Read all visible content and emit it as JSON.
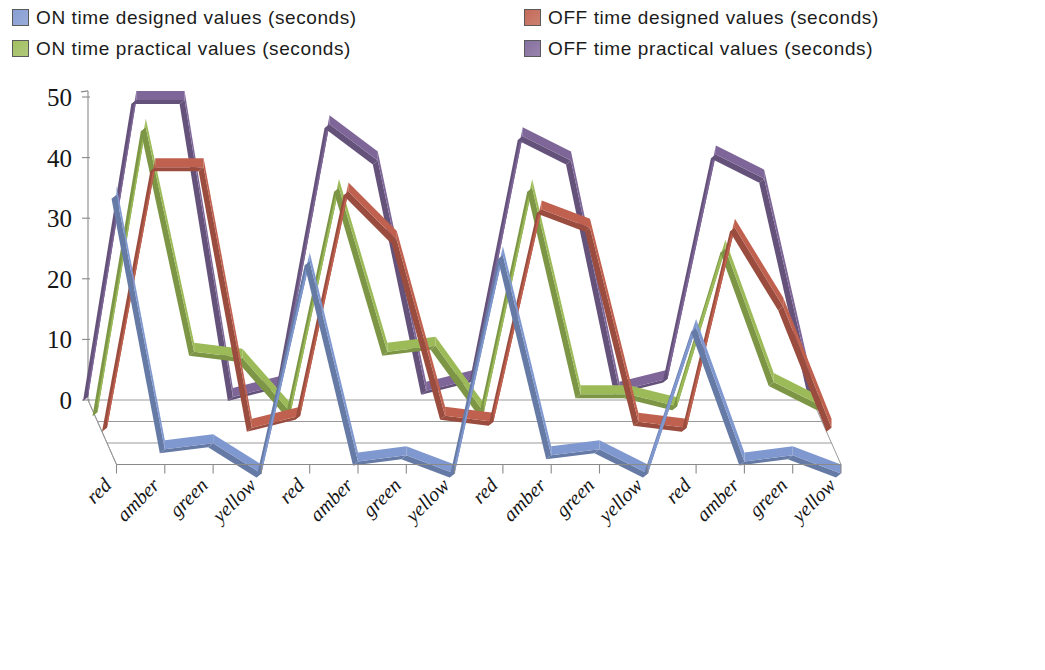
{
  "legend": {
    "items": [
      {
        "label": "ON time designed values (seconds)",
        "color": "#8098d0",
        "icon": "legend-swatch-blue"
      },
      {
        "label": "OFF time designed values (seconds)",
        "color": "#c0604e",
        "icon": "legend-swatch-red"
      },
      {
        "label": "ON time practical values (seconds)",
        "color": "#9cbb58",
        "icon": "legend-swatch-green"
      },
      {
        "label": "OFF time practical values (seconds)",
        "color": "#7e6699",
        "icon": "legend-swatch-purple"
      }
    ]
  },
  "axes": {
    "y_ticks": [
      "0",
      "10",
      "20",
      "30",
      "40",
      "50"
    ],
    "y_min": 0,
    "y_max": 50,
    "x_categories": [
      "red",
      "amber",
      "green",
      "yellow",
      "red",
      "amber",
      "green",
      "yellow",
      "red",
      "amber",
      "green",
      "yellow",
      "red",
      "amber",
      "green",
      "yellow"
    ]
  },
  "chart_data": {
    "type": "line",
    "title": "",
    "xlabel": "",
    "ylabel": "",
    "ylim": [
      0,
      50
    ],
    "grid": false,
    "legend_position": "top",
    "projection": "3d",
    "categories": [
      "red",
      "amber",
      "green",
      "yellow",
      "red",
      "amber",
      "green",
      "yellow",
      "red",
      "amber",
      "green",
      "yellow",
      "red",
      "amber",
      "green",
      "yellow"
    ],
    "series": [
      {
        "name": "ON time designed values (seconds)",
        "color": "#8098d0",
        "values": [
          46,
          4,
          5,
          0,
          35,
          2,
          3,
          0,
          36,
          3,
          4,
          0,
          24,
          2,
          3,
          0
        ]
      },
      {
        "name": "OFF time designed values (seconds)",
        "color": "#c0604e",
        "values": [
          4,
          47,
          47,
          4,
          6,
          43,
          35,
          6,
          5,
          40,
          37,
          5,
          4,
          37,
          24,
          4
        ]
      },
      {
        "name": "ON time practical values (seconds)",
        "color": "#9cbb58",
        "values": [
          3,
          50,
          13,
          12,
          3,
          40,
          13,
          14,
          3,
          40,
          6,
          6,
          4,
          30,
          8,
          4
        ]
      },
      {
        "name": "OFF time practical values (seconds)",
        "color": "#7e6699",
        "values": [
          2,
          51,
          51,
          2,
          4,
          47,
          41,
          3,
          5,
          45,
          41,
          3,
          5,
          42,
          38,
          3
        ]
      }
    ]
  }
}
